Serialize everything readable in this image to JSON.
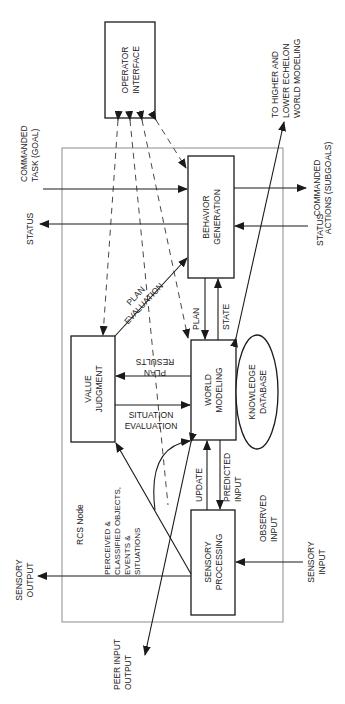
{
  "diagram": {
    "node_label": "RCS Node",
    "boxes": {
      "operator_interface": [
        "OPERATOR",
        "INTERFACE"
      ],
      "behavior_generation": [
        "BEHAVIOR",
        "GENERATION"
      ],
      "world_modeling": [
        "WORLD",
        "MODELING"
      ],
      "value_judgment": [
        "VALUE",
        "JUDGMENT"
      ],
      "sensory_processing": [
        "SENSORY",
        "PROCESSING"
      ],
      "knowledge_database": [
        "KNOWLEDGE",
        "DATABASE"
      ]
    },
    "labels": {
      "commanded_task": [
        "COMMANDED",
        "TASK (GOAL)"
      ],
      "status_out": "STATUS",
      "commanded_actions": [
        "COMMANDED",
        "ACTIONS (SUBGOALS)"
      ],
      "status_in": "STATUS",
      "higher_lower": [
        "TO HIGHER AND",
        "LOWER ECHELON",
        "WORLD MODELING"
      ],
      "plan_evaluation": [
        "PLAN",
        "EVALUATION"
      ],
      "plan": "PLAN",
      "state": "STATE",
      "plan_results": [
        "PLAN",
        "RESULTS"
      ],
      "situation_evaluation": [
        "SITUATION",
        "EVALUATION"
      ],
      "update": "UPDATE",
      "predicted_input": [
        "PREDICTED",
        "INPUT"
      ],
      "perceived": [
        "PERCEIVED &",
        "CLASSIFIED OBJECTS,",
        "EVENTS &",
        "SITUATIONS"
      ],
      "observed_input": [
        "OBSERVED",
        "INPUT"
      ],
      "sensory_output": [
        "SENSORY",
        "OUTPUT"
      ],
      "sensory_input": [
        "SENSORY",
        "INPUT"
      ],
      "peer": [
        "PEER INPUT",
        "OUTPUT"
      ]
    }
  }
}
